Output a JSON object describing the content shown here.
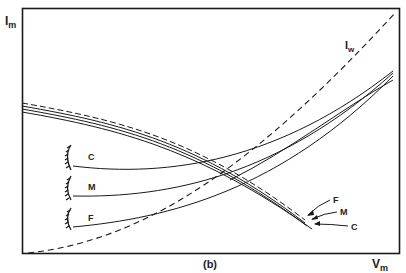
{
  "figure": {
    "panel_label": "(b)",
    "y_axis_label": "I",
    "y_axis_subscript": "m",
    "x_axis_label": "V",
    "x_axis_subscript": "m",
    "curve_iw_label": "I",
    "curve_iw_subscript": "w",
    "left_curves": [
      "C",
      "M",
      "F"
    ],
    "right_callouts": [
      "F",
      "M",
      "C"
    ],
    "colors": {
      "line": "#1a1a1a",
      "background": "#ffffff"
    }
  }
}
